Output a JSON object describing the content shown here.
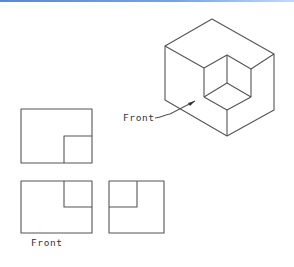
{
  "figure": {
    "type": "multiview-projection",
    "isometric_label": "Front",
    "front_view_label": "Front",
    "views": [
      "top",
      "front",
      "right-side"
    ],
    "line_color": "#555555",
    "header_bar_color": "#6b93df"
  }
}
